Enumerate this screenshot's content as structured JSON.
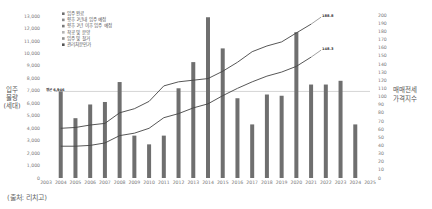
{
  "chart_data": {
    "type": "bar+line",
    "title": "",
    "categories": [
      "2003",
      "2004",
      "2005",
      "2006",
      "2007",
      "2008",
      "2009",
      "2010",
      "2011",
      "2012",
      "2013",
      "2014",
      "2015",
      "2016",
      "2017",
      "2018",
      "2019",
      "2020",
      "2021",
      "2022",
      "2023",
      "2024",
      "2025"
    ],
    "bars": {
      "name": "입주 물량",
      "values": [
        null,
        6950,
        4800,
        5900,
        6100,
        7700,
        3400,
        2700,
        3400,
        7200,
        9300,
        12900,
        10400,
        6400,
        4300,
        6700,
        6600,
        11700,
        7500,
        7500,
        7800,
        4300,
        null
      ],
      "color": "#6f6f6f"
    },
    "series": [
      {
        "name": "매매가격지수",
        "axis": "right",
        "color": "#444444",
        "values": [
          null,
          61,
          62,
          65,
          67,
          80,
          85,
          94,
          113,
          118,
          120,
          122,
          131,
          142,
          155,
          162,
          167,
          178,
          188.8,
          null,
          null,
          null,
          null
        ],
        "end_label": "188.8"
      },
      {
        "name": "전세가격지수",
        "axis": "right",
        "color": "#444444",
        "values": [
          null,
          39,
          39,
          40,
          43,
          52,
          55,
          61,
          74,
          79,
          86,
          91,
          101,
          110,
          118,
          125,
          130,
          137,
          148.3,
          null,
          null,
          null,
          null
        ],
        "end_label": "148.3"
      }
    ],
    "reference_line": {
      "label": "평균 6,946",
      "value": 6946
    },
    "left_axis": {
      "label_lines": [
        "입주",
        "물량",
        "(세대)"
      ],
      "ticks": [
        "0",
        "1,000",
        "2,000",
        "3,000",
        "4,000",
        "5,000",
        "6,000",
        "7,000",
        "8,000",
        "9,000",
        "10,000",
        "11,000",
        "12,000",
        "13,000"
      ],
      "ylim": [
        0,
        13000
      ]
    },
    "right_axis": {
      "label_lines": [
        "매매전세",
        "가격지수"
      ],
      "ticks": [
        "0",
        "10",
        "20",
        "30",
        "40",
        "50",
        "60",
        "70",
        "80",
        "90",
        "100",
        "110",
        "120",
        "130",
        "140",
        "150",
        "160",
        "170",
        "180",
        "190",
        "200"
      ],
      "ylim": [
        0,
        200
      ]
    },
    "legend": [
      {
        "label": "입주 완료",
        "color": "#6f6f6f"
      },
      {
        "label": "향후 2년내 입주 예정",
        "color": "#8a8a8a"
      },
      {
        "label": "향후 2년 이후 입주 예정",
        "color": "#7a7a7a"
      },
      {
        "label": "착공 및 분양",
        "color": "#b5b5b5"
      },
      {
        "label": "입주 및 철거",
        "color": "#909090"
      },
      {
        "label": "관리처분인가",
        "color": "#555555"
      }
    ],
    "legend_position": "top-left",
    "grid": false
  },
  "footer": {
    "source": "(출처: 리치고)"
  }
}
